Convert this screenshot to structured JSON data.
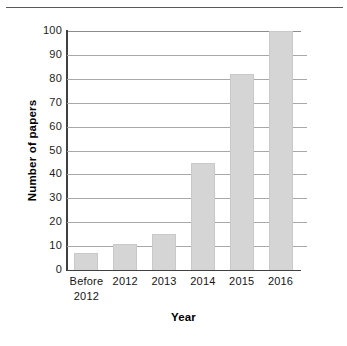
{
  "chart_data": {
    "type": "bar",
    "title": "",
    "xlabel": "Year",
    "ylabel": "Number of papers",
    "categories": [
      "Before 2012",
      "2012",
      "2013",
      "2014",
      "2015",
      "2016"
    ],
    "category_lines": [
      [
        "Before",
        "2012"
      ],
      [
        "2012"
      ],
      [
        "2013"
      ],
      [
        "2014"
      ],
      [
        "2015"
      ],
      [
        "2016"
      ]
    ],
    "values": [
      7,
      11,
      15,
      45,
      82,
      100
    ],
    "ylim": [
      0,
      100
    ],
    "yticks": [
      0,
      10,
      20,
      30,
      40,
      50,
      60,
      70,
      80,
      90,
      100
    ],
    "ytick_labels": [
      "0",
      "10",
      "20",
      "30",
      "40",
      "50",
      "60",
      "70",
      "80",
      "90",
      "100"
    ],
    "grid": true,
    "legend": "none",
    "bar_color": "#d5d5d5",
    "axis_color": "#404040",
    "grid_color": "#a8a8a8"
  }
}
